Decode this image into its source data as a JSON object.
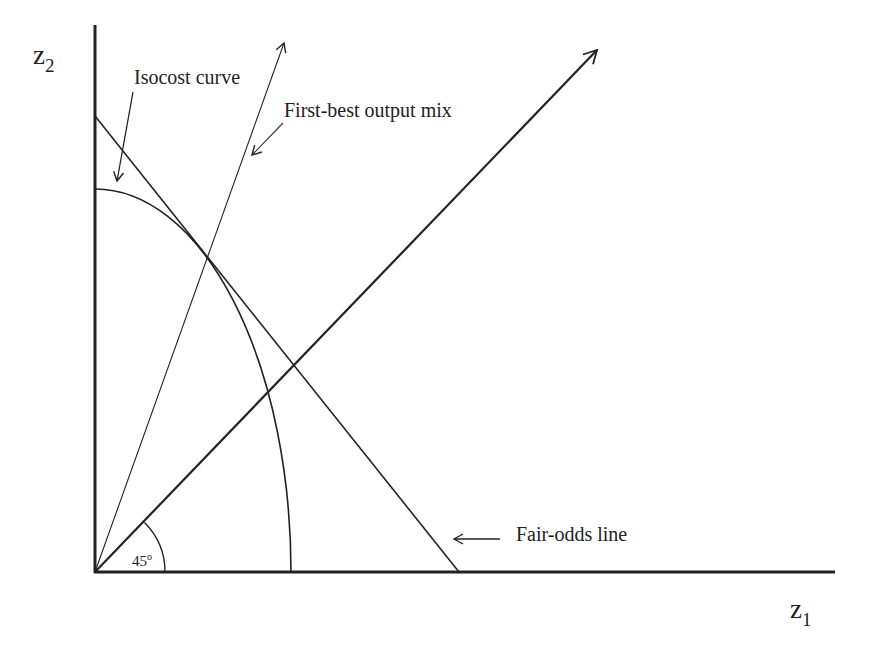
{
  "diagram": {
    "axes": {
      "x_label": "z",
      "x_label_sub": "1",
      "y_label": "z",
      "y_label_sub": "2"
    },
    "labels": {
      "isocost": "Isocost curve",
      "first_best": "First-best output mix",
      "fair_odds": "Fair-odds line",
      "angle": "45",
      "angle_unit": "o"
    },
    "colors": {
      "line": "#222222",
      "background": "#ffffff"
    },
    "elements": [
      {
        "name": "y-axis",
        "type": "line"
      },
      {
        "name": "x-axis",
        "type": "line"
      },
      {
        "name": "isocost-curve",
        "type": "concave quarter-ellipse from z2-axis to z1-axis"
      },
      {
        "name": "fair-odds-line",
        "type": "straight line tangent to isocost curve"
      },
      {
        "name": "first-best-ray",
        "type": "arrow ray from origin through tangency point"
      },
      {
        "name": "certainty-line",
        "type": "45-degree arrow ray from origin"
      }
    ]
  }
}
